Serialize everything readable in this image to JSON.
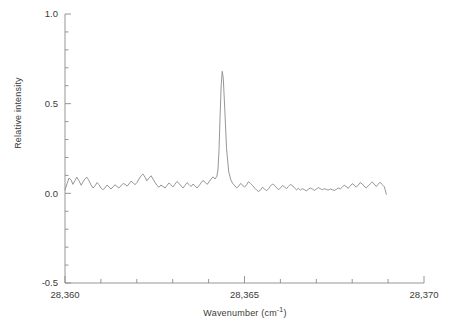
{
  "chart_data": {
    "type": "line",
    "title": "",
    "xlabel": "Wavenumber (cm",
    "xlabel_sup": "-1",
    "xlabel_tail": ")",
    "ylabel": "Relative intensity",
    "xlim": [
      28360,
      28370
    ],
    "ylim": [
      -0.5,
      1.0
    ],
    "x_major_ticks": [
      28360,
      28365,
      28370
    ],
    "x_major_tick_labels": [
      "28,360",
      "28,365",
      "28,370"
    ],
    "x_minor_tick_step": 1,
    "y_major_ticks": [
      -0.5,
      0.0,
      0.5,
      1.0
    ],
    "y_major_tick_labels": [
      "-0.5",
      "0.0",
      "0.5",
      "1.0"
    ],
    "y_minor_tick_step": 0.1,
    "grid": false,
    "legend": null,
    "line_color": "#8a8a8a",
    "axis_color": "#8a8a8a",
    "peak": {
      "center": 28364.3,
      "height": 0.68,
      "fwhm": 0.13
    },
    "data_x_range": [
      28360.0,
      28368.95
    ],
    "series": [
      {
        "name": "spectrum",
        "x": [
          28360.0,
          28360.06,
          28360.11,
          28360.17,
          28360.22,
          28360.28,
          28360.33,
          28360.39,
          28360.45,
          28360.5,
          28360.56,
          28360.61,
          28360.67,
          28360.72,
          28360.78,
          28360.84,
          28360.89,
          28360.95,
          28361.0,
          28361.06,
          28361.11,
          28361.17,
          28361.23,
          28361.28,
          28361.34,
          28361.39,
          28361.45,
          28361.5,
          28361.56,
          28361.62,
          28361.67,
          28361.73,
          28361.78,
          28361.84,
          28361.89,
          28361.95,
          28362.01,
          28362.06,
          28362.12,
          28362.17,
          28362.23,
          28362.28,
          28362.34,
          28362.4,
          28362.45,
          28362.51,
          28362.56,
          28362.62,
          28362.67,
          28362.73,
          28362.79,
          28362.84,
          28362.9,
          28362.95,
          28363.01,
          28363.06,
          28363.12,
          28363.18,
          28363.23,
          28363.29,
          28363.34,
          28363.4,
          28363.45,
          28363.51,
          28363.57,
          28363.62,
          28363.68,
          28363.73,
          28363.79,
          28363.84,
          28363.9,
          28363.96,
          28364.01,
          28364.07,
          28364.12,
          28364.18,
          28364.23,
          28364.26,
          28364.29,
          28364.32,
          28364.35,
          28364.38,
          28364.41,
          28364.45,
          28364.5,
          28364.56,
          28364.62,
          28364.67,
          28364.73,
          28364.78,
          28364.84,
          28364.89,
          28364.95,
          28365.0,
          28365.06,
          28365.11,
          28365.17,
          28365.23,
          28365.28,
          28365.34,
          28365.39,
          28365.45,
          28365.5,
          28365.56,
          28365.61,
          28365.67,
          28365.72,
          28365.78,
          28365.84,
          28365.89,
          28365.95,
          28366.0,
          28366.06,
          28366.11,
          28366.17,
          28366.22,
          28366.28,
          28366.34,
          28366.39,
          28366.45,
          28366.5,
          28366.56,
          28366.61,
          28366.67,
          28366.72,
          28366.78,
          28366.83,
          28366.89,
          28366.95,
          28367.0,
          28367.06,
          28367.11,
          28367.17,
          28367.22,
          28367.28,
          28367.33,
          28367.39,
          28367.45,
          28367.5,
          28367.56,
          28367.61,
          28367.67,
          28367.72,
          28367.78,
          28367.83,
          28367.89,
          28367.94,
          28368.0,
          28368.06,
          28368.11,
          28368.17,
          28368.22,
          28368.28,
          28368.33,
          28368.39,
          28368.44,
          28368.5,
          28368.56,
          28368.61,
          28368.67,
          28368.72,
          28368.78,
          28368.83,
          28368.89,
          28368.92,
          28368.95
        ],
        "y": [
          0.02,
          0.055,
          0.085,
          0.075,
          0.05,
          0.072,
          0.09,
          0.07,
          0.045,
          0.063,
          0.082,
          0.09,
          0.07,
          0.048,
          0.03,
          0.042,
          0.06,
          0.048,
          0.03,
          0.02,
          0.03,
          0.046,
          0.035,
          0.024,
          0.036,
          0.048,
          0.038,
          0.03,
          0.042,
          0.055,
          0.05,
          0.04,
          0.052,
          0.068,
          0.06,
          0.048,
          0.062,
          0.08,
          0.098,
          0.108,
          0.09,
          0.07,
          0.086,
          0.098,
          0.08,
          0.06,
          0.045,
          0.034,
          0.046,
          0.038,
          0.03,
          0.044,
          0.058,
          0.048,
          0.036,
          0.05,
          0.066,
          0.055,
          0.042,
          0.03,
          0.044,
          0.06,
          0.05,
          0.038,
          0.052,
          0.04,
          0.03,
          0.042,
          0.058,
          0.072,
          0.062,
          0.05,
          0.064,
          0.08,
          0.092,
          0.08,
          0.095,
          0.13,
          0.24,
          0.43,
          0.6,
          0.68,
          0.64,
          0.47,
          0.25,
          0.12,
          0.075,
          0.055,
          0.042,
          0.03,
          0.04,
          0.055,
          0.046,
          0.034,
          0.048,
          0.065,
          0.055,
          0.042,
          0.03,
          0.018,
          0.01,
          0.02,
          0.034,
          0.024,
          0.014,
          0.026,
          0.04,
          0.052,
          0.044,
          0.032,
          0.02,
          0.03,
          0.044,
          0.036,
          0.026,
          0.038,
          0.05,
          0.042,
          0.03,
          0.02,
          0.028,
          0.018,
          0.026,
          0.02,
          0.014,
          0.022,
          0.03,
          0.024,
          0.016,
          0.024,
          0.032,
          0.026,
          0.02,
          0.026,
          0.022,
          0.018,
          0.024,
          0.02,
          0.016,
          0.022,
          0.03,
          0.024,
          0.034,
          0.046,
          0.038,
          0.028,
          0.04,
          0.054,
          0.046,
          0.034,
          0.046,
          0.06,
          0.052,
          0.04,
          0.03,
          0.04,
          0.052,
          0.064,
          0.052,
          0.038,
          0.05,
          0.062,
          0.05,
          0.038,
          0.02,
          -0.005
        ]
      }
    ]
  }
}
